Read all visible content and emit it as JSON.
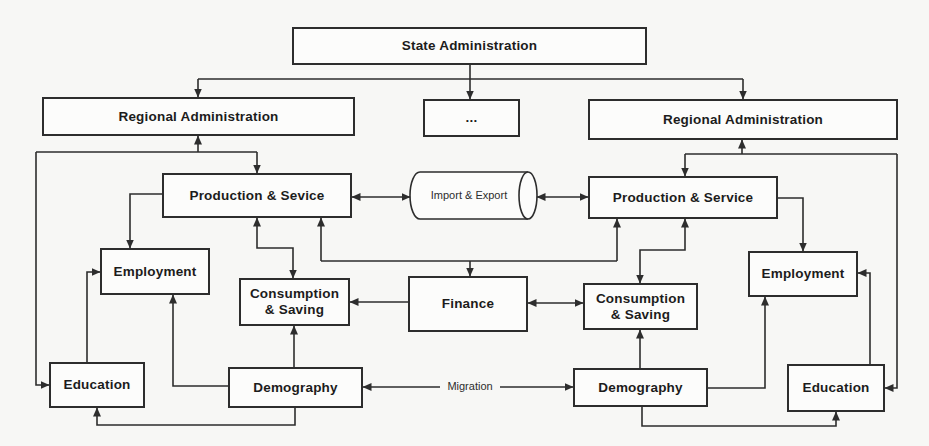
{
  "figure": {
    "title_hint": "Administrative-economic system block diagram",
    "colors": {
      "background": "#f7f7f5",
      "box_fill": "#fcfcfb",
      "line": "#2d2d2d",
      "text": "#1c1c1c"
    }
  },
  "nodes": {
    "state_admin": {
      "label": "State Administration"
    },
    "regional_admin_left": {
      "label": "Regional Administration"
    },
    "ellipsis": {
      "label": "..."
    },
    "regional_admin_right": {
      "label": "Regional Administration"
    },
    "production_left": {
      "label": "Production & Sevice"
    },
    "import_export": {
      "label": "Import & Export"
    },
    "production_right": {
      "label": "Production & Service"
    },
    "employment_left": {
      "label": "Employment"
    },
    "employment_right": {
      "label": "Employment"
    },
    "consumption_left": {
      "label": "Consumption & Saving",
      "line1": "Consumption",
      "line2": "& Saving"
    },
    "finance": {
      "label": "Finance"
    },
    "consumption_right": {
      "label": "Consumption & Saving",
      "line1": "Consumption",
      "line2": "& Saving"
    },
    "education_left": {
      "label": "Education"
    },
    "education_right": {
      "label": "Education"
    },
    "demography_left": {
      "label": "Demography"
    },
    "demography_right": {
      "label": "Demography"
    }
  },
  "edge_labels": {
    "migration": "Migration"
  },
  "edges": [
    {
      "from": "state_admin",
      "to": "regional_admin_left",
      "arrow": "forward"
    },
    {
      "from": "state_admin",
      "to": "ellipsis",
      "arrow": "forward"
    },
    {
      "from": "state_admin",
      "to": "regional_admin_right",
      "arrow": "forward"
    },
    {
      "from": "regional_admin_left",
      "to": "production_left",
      "arrow": "both"
    },
    {
      "from": "regional_admin_left",
      "to": "education_left",
      "arrow": "forward"
    },
    {
      "from": "production_left",
      "to": "employment_left",
      "arrow": "forward"
    },
    {
      "from": "production_left",
      "to": "consumption_left",
      "arrow": "both"
    },
    {
      "from": "production_left",
      "to": "import_export",
      "arrow": "both"
    },
    {
      "from": "import_export",
      "to": "production_right",
      "arrow": "both"
    },
    {
      "from": "finance_hub",
      "to": "production_left",
      "arrow": "forward"
    },
    {
      "from": "finance_hub",
      "to": "production_right",
      "arrow": "forward"
    },
    {
      "from": "finance_hub",
      "to": "finance",
      "arrow": "forward"
    },
    {
      "from": "finance",
      "to": "consumption_left",
      "arrow": "forward"
    },
    {
      "from": "finance",
      "to": "consumption_right",
      "arrow": "both"
    },
    {
      "from": "regional_admin_right",
      "to": "production_right",
      "arrow": "both"
    },
    {
      "from": "regional_admin_right",
      "to": "education_right",
      "arrow": "forward"
    },
    {
      "from": "production_right",
      "to": "employment_right",
      "arrow": "forward"
    },
    {
      "from": "production_right",
      "to": "consumption_right",
      "arrow": "both"
    },
    {
      "from": "demography_left",
      "to": "consumption_left",
      "arrow": "forward"
    },
    {
      "from": "demography_left",
      "to": "employment_left",
      "arrow": "forward"
    },
    {
      "from": "demography_left",
      "to": "education_left",
      "arrow": "forward"
    },
    {
      "from": "education_left",
      "to": "employment_left",
      "arrow": "forward"
    },
    {
      "from": "demography_right",
      "to": "consumption_right",
      "arrow": "forward"
    },
    {
      "from": "demography_right",
      "to": "employment_right",
      "arrow": "forward"
    },
    {
      "from": "demography_right",
      "to": "education_right",
      "arrow": "forward"
    },
    {
      "from": "education_right",
      "to": "employment_right",
      "arrow": "forward"
    },
    {
      "from": "demography_left",
      "to": "demography_right",
      "arrow": "both",
      "label": "Migration"
    }
  ]
}
